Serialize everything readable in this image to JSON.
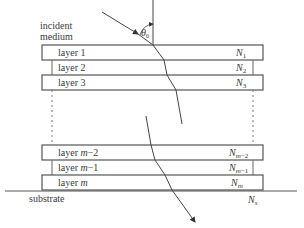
{
  "incident_label_line1": "incident",
  "incident_label_line2": "medium",
  "angle_label": "θ0",
  "substrate_label": "substrate",
  "substrate_index": "Ns",
  "layers": [
    {
      "label": "layer 1",
      "index": "N1"
    },
    {
      "label": "layer 2",
      "index": "N2"
    },
    {
      "label": "layer 3",
      "index": "N3"
    },
    {
      "label": "layer m−2",
      "index": "Nm−2"
    },
    {
      "label": "layer m−1",
      "index": "Nm−1"
    },
    {
      "label": "layer m",
      "index": "Nm"
    }
  ],
  "colors": {
    "line": "#444444",
    "text": "#3a3a3a"
  }
}
